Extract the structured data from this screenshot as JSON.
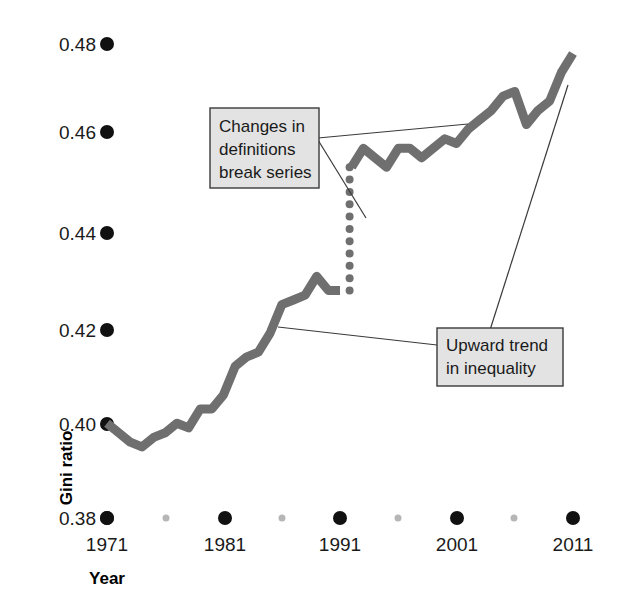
{
  "chart_data": {
    "type": "line",
    "title": "",
    "subtitle": "",
    "xlabel": "Year",
    "ylabel": "Gini ratio",
    "xlim": [
      1971,
      2012
    ],
    "ylim": [
      0.38,
      0.48
    ],
    "grid": false,
    "legend": "none",
    "line_color": "#6f6f6f",
    "tick_dot_color": "#111111",
    "minor_tick_dot_color": "#b6b6b6",
    "y_ticks": [
      "0.48",
      "0.46",
      "0.44",
      "0.42",
      "0.40",
      "0.38"
    ],
    "y_tick_values": [
      0.48,
      0.46,
      0.44,
      0.42,
      0.4,
      0.38
    ],
    "x_ticks": [
      "1971",
      "1981",
      "1991",
      "2001",
      "2011"
    ],
    "x_tick_values": [
      1971,
      1981,
      1991,
      2001,
      2011
    ],
    "x_minor_tick_values": [
      1976,
      1986,
      1996,
      2006
    ],
    "break_year": 1992,
    "series": [
      {
        "name": "Gini ratio (pre-1992 definition)",
        "x": [
          1971,
          1972,
          1973,
          1974,
          1975,
          1976,
          1977,
          1978,
          1979,
          1980,
          1981,
          1982,
          1983,
          1984,
          1985,
          1986,
          1987,
          1988,
          1989,
          1990,
          1991
        ],
        "values": [
          0.4,
          0.398,
          0.396,
          0.395,
          0.397,
          0.398,
          0.4,
          0.399,
          0.403,
          0.403,
          0.406,
          0.412,
          0.414,
          0.415,
          0.419,
          0.425,
          0.426,
          0.427,
          0.431,
          0.428,
          0.428
        ]
      },
      {
        "name": "Gini ratio (post-1992 definition)",
        "x": [
          1992,
          1993,
          1994,
          1995,
          1996,
          1997,
          1998,
          1999,
          2000,
          2001,
          2002,
          2003,
          2004,
          2005,
          2006,
          2007,
          2008,
          2009,
          2010,
          2011
        ],
        "values": [
          0.454,
          0.458,
          0.456,
          0.454,
          0.458,
          0.458,
          0.456,
          0.458,
          0.46,
          0.459,
          0.462,
          0.464,
          0.466,
          0.469,
          0.47,
          0.463,
          0.466,
          0.468,
          0.474,
          0.478
        ]
      }
    ],
    "break_marker": {
      "style": "dotted-vertical",
      "from_value": 0.428,
      "to_value": 0.454,
      "year": 1992
    },
    "annotations": [
      {
        "id": "break-note",
        "lines": [
          "Changes in",
          "definitions",
          "break series"
        ],
        "points_to": [
          "break-dotted-series",
          "post-1992-series"
        ]
      },
      {
        "id": "trend-note",
        "lines": [
          "Upward trend",
          "in inequality"
        ],
        "points_to": [
          "pre-1992-series-mid-1980s",
          "post-2005-series"
        ]
      }
    ]
  }
}
